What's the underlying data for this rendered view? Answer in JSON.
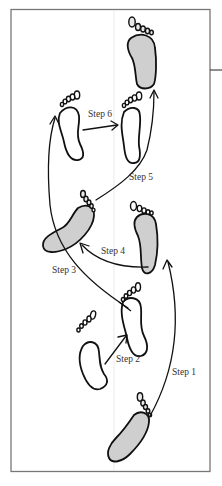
{
  "diagram": {
    "type": "footstep-sequence",
    "colors": {
      "frame": "#777777",
      "ink": "#111111",
      "filled_foot": "#cfcfcf",
      "label_text": "#333333",
      "background": "#ffffff"
    },
    "steps": [
      {
        "id": 1,
        "label": "Step 1"
      },
      {
        "id": 2,
        "label": "Step 2"
      },
      {
        "id": 3,
        "label": "Step 3"
      },
      {
        "id": 4,
        "label": "Step 4"
      },
      {
        "id": 5,
        "label": "Step 5"
      },
      {
        "id": 6,
        "label": "Step 6"
      }
    ],
    "feet": [
      {
        "name": "start-right-foot",
        "shaded": true
      },
      {
        "name": "left-foot-lower",
        "shaded": false
      },
      {
        "name": "right-foot-lower",
        "shaded": false
      },
      {
        "name": "right-foot-middle",
        "shaded": false
      },
      {
        "name": "left-foot-middle",
        "shaded": true
      },
      {
        "name": "left-foot-upper",
        "shaded": false
      },
      {
        "name": "right-foot-upper",
        "shaded": false
      },
      {
        "name": "end-foot-top",
        "shaded": true
      }
    ]
  }
}
